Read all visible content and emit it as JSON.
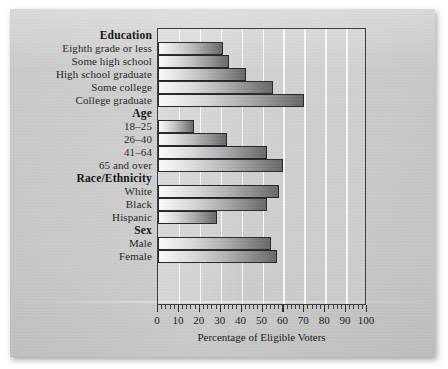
{
  "chart_data": {
    "type": "bar",
    "orientation": "horizontal",
    "title": "",
    "xlabel": "Percentage of Eligible Voters",
    "ylabel": "",
    "xlim": [
      0,
      100
    ],
    "xticks": [
      0,
      10,
      20,
      30,
      40,
      50,
      60,
      70,
      80,
      90,
      100
    ],
    "xtick_labels": [
      "0",
      "10",
      "20",
      "30",
      "40",
      "50",
      "60",
      "70",
      "80",
      "90",
      "100"
    ],
    "minor_tick_step": 2,
    "grid": "vertical-white-gridlines",
    "legend": "none",
    "groups": [
      {
        "name": "Education",
        "categories": [
          "Eighth grade or less",
          "Some high school",
          "High school graduate",
          "Some college",
          "College graduate"
        ],
        "values": [
          31,
          34,
          42,
          55,
          70
        ]
      },
      {
        "name": "Age",
        "categories": [
          "18–25",
          "26–40",
          "41–64",
          "65 and over"
        ],
        "values": [
          17,
          33,
          52,
          60
        ]
      },
      {
        "name": "Race/Ethnicity",
        "categories": [
          "White",
          "Black",
          "Hispanic"
        ],
        "values": [
          58,
          52,
          28
        ]
      },
      {
        "name": "Sex",
        "categories": [
          "Male",
          "Female"
        ],
        "values": [
          54,
          57
        ]
      }
    ],
    "categories": [
      "Eighth grade or less",
      "Some high school",
      "High school graduate",
      "Some college",
      "College graduate",
      "18–25",
      "26–40",
      "41–64",
      "65 and over",
      "White",
      "Black",
      "Hispanic",
      "Male",
      "Female"
    ],
    "values": [
      31,
      34,
      42,
      55,
      70,
      17,
      33,
      52,
      60,
      58,
      52,
      28,
      54,
      57
    ]
  },
  "colors": {
    "page_background": "#cdcdcd",
    "plot_frame": "#3b3b3b",
    "gridline": "#ffffff",
    "bar_light": "#fbfbfb",
    "bar_dark": "#67686b",
    "text": "#1d1d1d"
  }
}
